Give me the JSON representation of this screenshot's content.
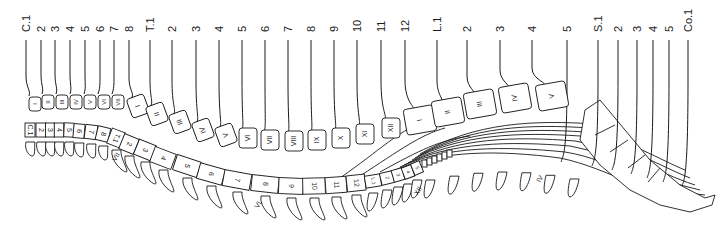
{
  "diagram": {
    "nerve_labels": [
      {
        "label": "C.1",
        "x": 26
      },
      {
        "label": "2",
        "x": 41
      },
      {
        "label": "3",
        "x": 55
      },
      {
        "label": "4",
        "x": 70
      },
      {
        "label": "5",
        "x": 85
      },
      {
        "label": "6",
        "x": 100
      },
      {
        "label": "7",
        "x": 114
      },
      {
        "label": "8",
        "x": 129
      },
      {
        "label": "T.1",
        "x": 150
      },
      {
        "label": "2",
        "x": 172
      },
      {
        "label": "3",
        "x": 196
      },
      {
        "label": "4",
        "x": 219
      },
      {
        "label": "5",
        "x": 242
      },
      {
        "label": "6",
        "x": 265
      },
      {
        "label": "7",
        "x": 288
      },
      {
        "label": "8",
        "x": 311
      },
      {
        "label": "9",
        "x": 334
      },
      {
        "label": "10",
        "x": 357
      },
      {
        "label": "11",
        "x": 381
      },
      {
        "label": "12",
        "x": 405
      },
      {
        "label": "L.1",
        "x": 437
      },
      {
        "label": "2",
        "x": 467
      },
      {
        "label": "3",
        "x": 500
      },
      {
        "label": "4",
        "x": 532
      },
      {
        "label": "5",
        "x": 567
      },
      {
        "label": "S.1",
        "x": 598
      },
      {
        "label": "2",
        "x": 618
      },
      {
        "label": "3",
        "x": 637
      },
      {
        "label": "4",
        "x": 653
      },
      {
        "label": "5",
        "x": 669
      },
      {
        "label": "Co.1",
        "x": 688
      }
    ],
    "vertebral_bodies": [
      {
        "label": "I",
        "x": 35,
        "y": 104
      },
      {
        "label": "II",
        "x": 48,
        "y": 102
      },
      {
        "label": "III",
        "x": 62,
        "y": 102
      },
      {
        "label": "IV",
        "x": 76,
        "y": 102
      },
      {
        "label": "V",
        "x": 90,
        "y": 102
      },
      {
        "label": "VI",
        "x": 104,
        "y": 102
      },
      {
        "label": "VII",
        "x": 118,
        "y": 102
      },
      {
        "label": "I",
        "x": 138,
        "y": 106
      },
      {
        "label": "II",
        "x": 157,
        "y": 114
      },
      {
        "label": "III",
        "x": 180,
        "y": 122
      },
      {
        "label": "IV",
        "x": 203,
        "y": 130
      },
      {
        "label": "V",
        "x": 226,
        "y": 135
      },
      {
        "label": "VI",
        "x": 248,
        "y": 138
      },
      {
        "label": "VII",
        "x": 270,
        "y": 140
      },
      {
        "label": "VIII",
        "x": 294,
        "y": 141
      },
      {
        "label": "IX",
        "x": 317,
        "y": 140
      },
      {
        "label": "X",
        "x": 341,
        "y": 138
      },
      {
        "label": "XI",
        "x": 365,
        "y": 134
      },
      {
        "label": "XII",
        "x": 391,
        "y": 128
      },
      {
        "label": "I",
        "x": 420,
        "y": 120
      },
      {
        "label": "II",
        "x": 448,
        "y": 112
      },
      {
        "label": "III",
        "x": 480,
        "y": 104
      },
      {
        "label": "IV",
        "x": 515,
        "y": 98
      },
      {
        "label": "V",
        "x": 552,
        "y": 96
      }
    ],
    "cord_segments": [
      {
        "label": "C.1",
        "x": 30,
        "y": 130
      },
      {
        "label": "2",
        "x": 41,
        "y": 130
      },
      {
        "label": "3",
        "x": 50,
        "y": 130
      },
      {
        "label": "4",
        "x": 59,
        "y": 130
      },
      {
        "label": "5",
        "x": 69,
        "y": 130
      },
      {
        "label": "6",
        "x": 79,
        "y": 131
      },
      {
        "label": "7",
        "x": 91,
        "y": 132
      },
      {
        "label": "8",
        "x": 103,
        "y": 134
      },
      {
        "label": "T.1",
        "x": 116,
        "y": 138
      },
      {
        "label": "2",
        "x": 129,
        "y": 144
      },
      {
        "label": "3",
        "x": 145,
        "y": 150
      },
      {
        "label": "4",
        "x": 163,
        "y": 158
      },
      {
        "label": "5",
        "x": 187,
        "y": 166
      },
      {
        "label": "6",
        "x": 211,
        "y": 174
      },
      {
        "label": "7",
        "x": 237,
        "y": 180
      },
      {
        "label": "8",
        "x": 265,
        "y": 184
      },
      {
        "label": "9",
        "x": 291,
        "y": 186
      },
      {
        "label": "10",
        "x": 314,
        "y": 186
      },
      {
        "label": "11",
        "x": 336,
        "y": 185
      },
      {
        "label": "12",
        "x": 356,
        "y": 183
      },
      {
        "label": "L.1",
        "x": 373,
        "y": 181
      },
      {
        "label": "2",
        "x": 387,
        "y": 178
      },
      {
        "label": "3",
        "x": 398,
        "y": 175
      },
      {
        "label": "4",
        "x": 408,
        "y": 172
      },
      {
        "label": "5",
        "x": 417,
        "y": 168
      }
    ],
    "spinous_labels": [
      {
        "label": "VII",
        "x": 118,
        "y": 158
      },
      {
        "label": "VI",
        "x": 260,
        "y": 206
      },
      {
        "label": "XII",
        "x": 420,
        "y": 192
      },
      {
        "label": "IV",
        "x": 542,
        "y": 180
      }
    ],
    "colors": {
      "ink": "#1a1a1a",
      "background": "#ffffff"
    }
  }
}
